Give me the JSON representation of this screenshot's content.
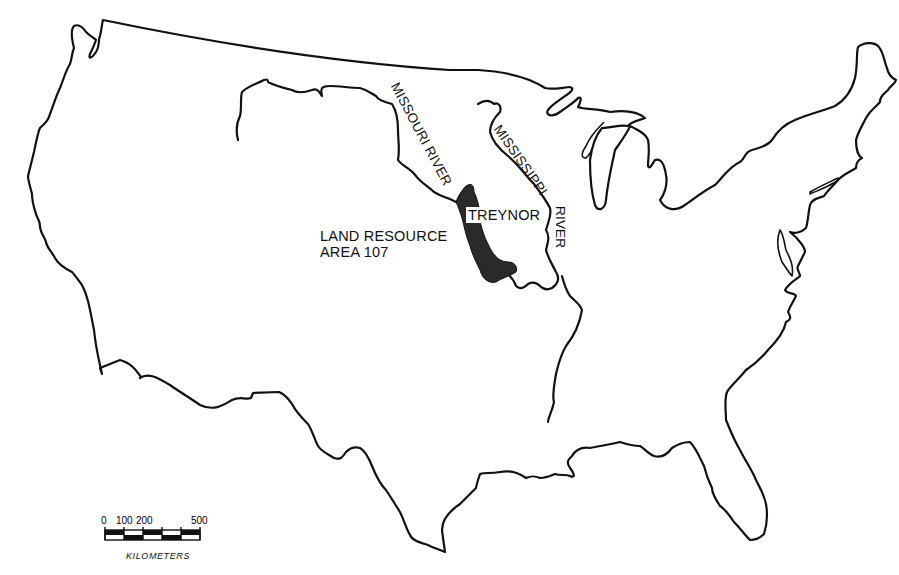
{
  "map": {
    "type": "outline map of the conterminous United States",
    "labels": {
      "missouri_river": "MISSOURI RIVER",
      "mississippi_river_line1": "MISSISSIPPI",
      "mississippi_river_line2": "RIVER",
      "treynor": "TREYNOR",
      "land_resource_area_line1": "LAND RESOURCE",
      "land_resource_area_line2": "AREA 107"
    },
    "highlighted_region": {
      "name": "Land Resource Area 107",
      "fill_color": "#2a2a2a"
    },
    "scale_bar": {
      "ticks": [
        "0",
        "100",
        "200",
        "500"
      ],
      "units": "KILOMETERS"
    },
    "colors": {
      "outline": "#111111",
      "background": "#ffffff"
    }
  }
}
